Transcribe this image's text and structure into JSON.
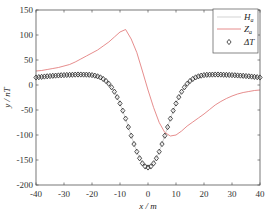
{
  "chart_data": {
    "type": "line",
    "title": "",
    "xlabel": "x / m",
    "ylabel": "y / nT",
    "xlim": [
      -40,
      40
    ],
    "ylim": [
      -200,
      150
    ],
    "xticks": [
      -40,
      -30,
      -20,
      -10,
      0,
      10,
      20,
      30,
      40
    ],
    "yticks": [
      150,
      100,
      50,
      0,
      -50,
      -100,
      -150,
      -200
    ],
    "xtick_labels": [
      "-40",
      "-30",
      "-20",
      "-10",
      "0",
      "10",
      "20",
      "30",
      "40"
    ],
    "ytick_labels": [
      "150",
      "100",
      "50",
      "0",
      "-50",
      "-100",
      "-150",
      "-200"
    ],
    "grid": false,
    "box": true,
    "legend_position": "top-right",
    "series": [
      {
        "name": "H_a",
        "label_main": "H",
        "label_sub": "a",
        "style": "line",
        "color": "#c8c8c8",
        "x": [
          -40,
          -38,
          -36,
          -34,
          -32,
          -30,
          -28,
          -26,
          -24,
          -22,
          -20,
          -18,
          -16,
          -14,
          -12,
          -10,
          -8,
          -6,
          -4,
          -2,
          0,
          2,
          4,
          6,
          8,
          10,
          12,
          14,
          16,
          18,
          20,
          22,
          24,
          26,
          28,
          30,
          32,
          34,
          36,
          38,
          40
        ],
        "y": [
          15.0,
          16.3,
          17.4,
          18.4,
          19.1,
          19.8,
          20.3,
          20.8,
          20.9,
          20.7,
          19.8,
          17.3,
          12.1,
          2.5,
          -13.4,
          -36.9,
          -67.2,
          -101.4,
          -133.4,
          -156.6,
          -165.0,
          -156.6,
          -133.4,
          -101.4,
          -67.2,
          -36.9,
          -13.4,
          2.5,
          12.1,
          17.3,
          19.8,
          20.7,
          20.9,
          20.8,
          20.3,
          19.8,
          19.1,
          18.4,
          17.4,
          16.3,
          15.0
        ]
      },
      {
        "name": "Z_a",
        "label_main": "Z",
        "label_sub": "a",
        "style": "line",
        "color": "#e07070",
        "x": [
          -40,
          -38,
          -36,
          -34,
          -32,
          -30,
          -28,
          -26,
          -24,
          -22,
          -20,
          -18,
          -16,
          -14,
          -12,
          -10,
          -8,
          -6,
          -4,
          -2,
          0,
          2,
          4,
          6,
          8,
          10,
          12,
          14,
          16,
          18,
          20,
          22,
          24,
          26,
          28,
          30,
          32,
          34,
          36,
          38,
          40
        ],
        "y": [
          28,
          29,
          31,
          33,
          35,
          38,
          41,
          46,
          52,
          58,
          64,
          70,
          78,
          86,
          96,
          106,
          111,
          92,
          65,
          28,
          -10,
          -45,
          -75,
          -95,
          -102,
          -100,
          -92,
          -82,
          -74,
          -66,
          -58,
          -49,
          -40,
          -33,
          -27,
          -22,
          -18,
          -15,
          -13,
          -11,
          -10
        ]
      },
      {
        "name": "ΔT",
        "label_main": "ΔT",
        "label_sub": "",
        "style": "diamond-markers",
        "color": "#222222",
        "x": [
          -40,
          -39,
          -38,
          -37,
          -36,
          -35,
          -34,
          -33,
          -32,
          -31,
          -30,
          -29,
          -28,
          -27,
          -26,
          -25,
          -24,
          -23,
          -22,
          -21,
          -20,
          -19,
          -18,
          -17,
          -16,
          -15,
          -14,
          -13,
          -12,
          -11,
          -10,
          -9,
          -8,
          -7,
          -6,
          -5,
          -4,
          -3,
          -2,
          -1,
          0,
          1,
          2,
          3,
          4,
          5,
          6,
          7,
          8,
          9,
          10,
          11,
          12,
          13,
          14,
          15,
          16,
          17,
          18,
          19,
          20,
          21,
          22,
          23,
          24,
          25,
          26,
          27,
          28,
          29,
          30,
          31,
          32,
          33,
          34,
          35,
          36,
          37,
          38,
          39,
          40
        ],
        "y": [
          15.0,
          15.7,
          16.3,
          16.9,
          17.4,
          17.9,
          18.4,
          18.8,
          19.1,
          19.5,
          19.8,
          20.1,
          20.3,
          20.5,
          20.8,
          20.9,
          20.9,
          20.8,
          20.7,
          20.4,
          19.8,
          18.8,
          17.3,
          15.2,
          12.1,
          8.0,
          2.5,
          -4.6,
          -13.4,
          -24.3,
          -36.9,
          -51.3,
          -67.2,
          -84.1,
          -101.4,
          -118.1,
          -133.4,
          -146.5,
          -156.6,
          -162.9,
          -165.0,
          -162.9,
          -156.6,
          -146.5,
          -133.4,
          -118.1,
          -101.4,
          -84.1,
          -67.2,
          -51.3,
          -36.9,
          -24.3,
          -13.4,
          -4.6,
          2.5,
          8.0,
          12.1,
          15.2,
          17.3,
          18.8,
          19.8,
          20.4,
          20.7,
          20.8,
          20.9,
          20.9,
          20.8,
          20.5,
          20.3,
          20.1,
          19.8,
          19.5,
          19.1,
          18.8,
          18.4,
          17.9,
          17.4,
          16.9,
          16.3,
          15.7,
          15.0
        ]
      }
    ]
  }
}
